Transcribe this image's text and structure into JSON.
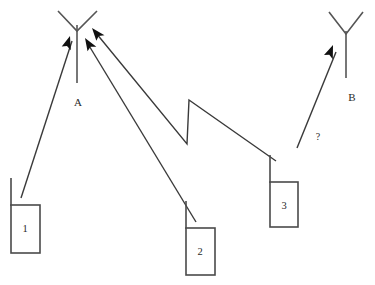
{
  "figure": {
    "background_color": "#ffffff",
    "width": 375,
    "height": 285,
    "line_color": "#3a3a3a",
    "arrow_color": "#111111",
    "text_color": "#2a2a2a"
  },
  "base_stations": [
    {
      "id": "A",
      "label": "A",
      "label_x": 78,
      "label_y": 103,
      "mast_x": 77,
      "mast_top_y": 25,
      "mast_bottom_y": 83,
      "v_left_x": 58,
      "v_left_y": 11,
      "v_right_x": 97,
      "v_right_y": 11,
      "v_vertex_x": 77,
      "v_vertex_y": 31
    },
    {
      "id": "B",
      "label": "B",
      "label_x": 352,
      "label_y": 98,
      "mast_x": 346,
      "mast_top_y": 31,
      "mast_bottom_y": 78,
      "v_left_x": 329,
      "v_left_y": 12,
      "v_right_x": 363,
      "v_right_y": 12,
      "v_vertex_x": 346,
      "v_vertex_y": 34
    }
  ],
  "handsets": [
    {
      "id": "1",
      "label": "1",
      "box_x": 11,
      "box_y": 205,
      "box_w": 29,
      "box_h": 48,
      "label_x": 25,
      "label_y": 230,
      "stub_x1": 11,
      "stub_y1": 178,
      "stub_x2": 11,
      "stub_y2": 205
    },
    {
      "id": "2",
      "label": "2",
      "box_x": 186,
      "box_y": 228,
      "box_w": 29,
      "box_h": 47,
      "label_x": 200,
      "label_y": 253,
      "stub_x1": 186,
      "stub_y1": 201,
      "stub_x2": 186,
      "stub_y2": 228
    },
    {
      "id": "3",
      "label": "3",
      "box_x": 270,
      "box_y": 182,
      "box_w": 28,
      "box_h": 45,
      "label_x": 284,
      "label_y": 207,
      "stub_x1": 270,
      "stub_y1": 155,
      "stub_x2": 270,
      "stub_y2": 182
    }
  ],
  "signal_links": [
    {
      "id": "link-1-to-A",
      "from": "1",
      "to": "A",
      "kind": "straight",
      "path": "M 21,198 L 72,41",
      "arrow_tip_x": 70,
      "arrow_tip_y": 36,
      "arrow_angle_deg": -72,
      "label": ""
    },
    {
      "id": "link-2-to-A",
      "from": "2",
      "to": "A",
      "kind": "straight",
      "path": "M 196,222 L 88,44",
      "arrow_tip_x": 85,
      "arrow_tip_y": 38,
      "arrow_angle_deg": -121,
      "label": ""
    },
    {
      "id": "link-3-to-A",
      "from": "3",
      "to": "A",
      "kind": "zigzag",
      "path": "M 276,161 L 189,100 L 187,144 L 96,33",
      "arrow_tip_x": 92,
      "arrow_tip_y": 28,
      "arrow_angle_deg": -129,
      "label": ""
    },
    {
      "id": "link-3-to-B",
      "from": "3",
      "to": "B",
      "kind": "straight",
      "path": "M 297,148 L 336,52",
      "arrow_tip_x": 333,
      "arrow_tip_y": 45,
      "arrow_angle_deg": -68,
      "label": "?"
    }
  ],
  "annotations": [
    {
      "id": "unknown-handover-marker",
      "text": "?",
      "x": 318,
      "y": 138
    }
  ]
}
